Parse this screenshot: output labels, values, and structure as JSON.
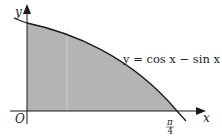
{
  "figure": {
    "type": "function-graph",
    "equation_label": "y = cos x − sin x",
    "axis_x_label": "x",
    "axis_y_label": "y",
    "origin_label": "O",
    "tick_label": {
      "numerator": "π",
      "denominator": "4"
    },
    "shaded_region": "area under curve from x = 0 to x = π/4",
    "colors": {
      "shade": "#b4b4b4",
      "curve": "#1a1a1a",
      "axis": "#1a1a1a",
      "background": "#ffffff"
    }
  }
}
